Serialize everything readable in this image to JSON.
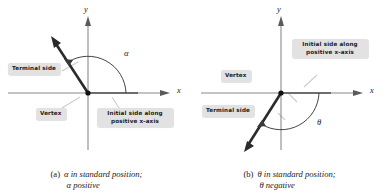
{
  "figure": {
    "background_color": "#ffffff",
    "axis_color": "#8a8a8a",
    "ray_color": "#2b2b2b",
    "arc_color": "#3a3a3a",
    "callout_bg": "#e2e2e2",
    "callout_text_color": "#202020",
    "leader_color": "#c9c9c9"
  },
  "panels": [
    {
      "id": "panel-a",
      "caption_label": "(a)",
      "caption_line1": "α in standard position;",
      "caption_line2": "α positive",
      "caption_symbol": "α",
      "angle_symbol": "α",
      "angle_sign": "positive",
      "axis_x_label": "x",
      "axis_y_label": "y",
      "callouts": [
        {
          "name": "terminal-side",
          "text": "Terminal side"
        },
        {
          "name": "vertex",
          "text": "Vertex"
        },
        {
          "name": "initial-side",
          "line1": "Initial side along",
          "line2": "positive x-axis"
        }
      ]
    },
    {
      "id": "panel-b",
      "caption_label": "(b)",
      "caption_line1": "θ in standard position;",
      "caption_line2": "θ negative",
      "caption_symbol": "θ",
      "angle_symbol": "θ",
      "angle_sign": "negative",
      "axis_x_label": "x",
      "axis_y_label": "y",
      "callouts": [
        {
          "name": "initial-side",
          "line1": "Initial side along",
          "line2": "positive x-axis"
        },
        {
          "name": "vertex",
          "text": "Vertex"
        },
        {
          "name": "terminal-side",
          "text": "Terminal side"
        }
      ]
    }
  ]
}
